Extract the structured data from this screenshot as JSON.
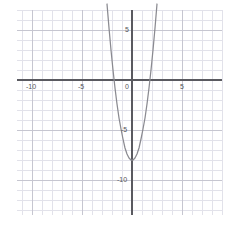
{
  "figure": {
    "kind": "coordinate-grid-plot",
    "background_color": "#ffffff",
    "plot_area": {
      "left": 17,
      "top": 10,
      "right": 222,
      "bottom": 215
    },
    "minor_grid_color": "#e2e2ea",
    "major_grid_color": "#c6c6d0",
    "axis_color": "#5a5a60",
    "curve_color": "#8a8a90",
    "label_color": "#555558"
  },
  "axes": {
    "x": {
      "label": "",
      "min": -11.5,
      "max": 9.0,
      "major_step": 5,
      "minor_step": 1,
      "tick_labels": [
        {
          "value": -10,
          "text": "-10"
        },
        {
          "value": -5,
          "text": "-5"
        },
        {
          "value": 0,
          "text": "0"
        },
        {
          "value": 5,
          "text": "5"
        }
      ]
    },
    "y": {
      "label": "",
      "min": -13.5,
      "max": 7.0,
      "major_step": 5,
      "minor_step": 1,
      "tick_labels": [
        {
          "value": 5,
          "text": "5"
        },
        {
          "value": -5,
          "text": "-5"
        },
        {
          "value": -10,
          "text": "-10"
        }
      ]
    }
  },
  "chart_data": {
    "type": "line",
    "title": "",
    "xlabel": "",
    "ylabel": "",
    "xlim": [
      -11.5,
      9.0
    ],
    "ylim": [
      -13.5,
      7.0
    ],
    "grid": true,
    "legend": "none",
    "series": [
      {
        "name": "parabola",
        "equation": "y = 2.5x^2 - 8",
        "vertex": [
          0,
          -8
        ],
        "x_intercepts": [
          -1.79,
          1.79
        ],
        "y_intercept": -8,
        "color": "#8a8a90",
        "x": [
          -2.5,
          -2.3,
          -2.1,
          -1.9,
          -1.7,
          -1.5,
          -1.3,
          -1.1,
          -0.9,
          -0.7,
          -0.5,
          -0.3,
          -0.1,
          0,
          0.1,
          0.3,
          0.5,
          0.7,
          0.9,
          1.1,
          1.3,
          1.5,
          1.7,
          1.9,
          2.1,
          2.3,
          2.5
        ],
        "y": [
          7.6,
          5.2,
          3.0,
          1.0,
          -0.8,
          -2.4,
          -3.8,
          -4.9,
          -5.9,
          -6.8,
          -7.4,
          -7.8,
          -8.0,
          -8.0,
          -8.0,
          -7.8,
          -7.4,
          -6.8,
          -5.9,
          -4.9,
          -3.8,
          -2.4,
          -0.8,
          1.0,
          3.0,
          5.2,
          7.6
        ]
      }
    ]
  }
}
